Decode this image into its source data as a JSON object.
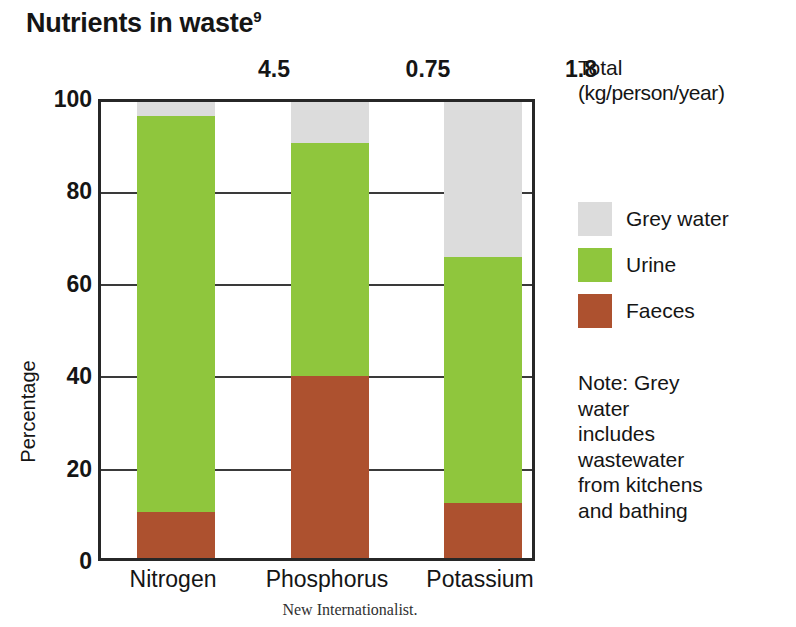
{
  "title": {
    "text": "Nutrients in waste",
    "superscript": "9"
  },
  "source": "New Internationalist.",
  "totals_caption": {
    "line1": "Total",
    "line2": "(kg/person/year)"
  },
  "legend": {
    "items": [
      {
        "label": "Grey water",
        "color": "#dcdcdc",
        "key": "grey_water"
      },
      {
        "label": "Urine",
        "color": "#8fc63d",
        "key": "urine"
      },
      {
        "label": "Faeces",
        "color": "#ad512f",
        "key": "faeces"
      }
    ]
  },
  "note": {
    "lines": [
      "Note: Grey",
      "water",
      "includes",
      "wastewater",
      "from kitchens",
      "and bathing"
    ]
  },
  "axes": {
    "y_title": "Percentage",
    "y_ticks": [
      "100",
      "80",
      "60",
      "40",
      "20",
      "0"
    ]
  },
  "chart_data": {
    "type": "bar",
    "subtype": "stacked-bar-100",
    "title": "Nutrients in waste",
    "xlabel": "",
    "ylabel": "Percentage",
    "ylim": [
      0,
      100
    ],
    "yticks": [
      0,
      20,
      40,
      60,
      80,
      100
    ],
    "grid": true,
    "legend_position": "right",
    "categories": [
      "Nitrogen",
      "Phosphorus",
      "Potassium"
    ],
    "category_totals": [
      "4.5",
      "0.75",
      "1.8"
    ],
    "category_totals_units": "kg/person/year",
    "series": [
      {
        "name": "Faeces",
        "color": "#ad512f",
        "values": [
          10,
          40,
          12
        ]
      },
      {
        "name": "Urine",
        "color": "#8fc63d",
        "values": [
          87,
          51,
          54
        ]
      },
      {
        "name": "Grey water",
        "color": "#dcdcdc",
        "values": [
          3,
          9,
          34
        ]
      }
    ],
    "stack_tops": {
      "Nitrogen": {
        "faeces": 10,
        "urine": 97,
        "grey_water": 100
      },
      "Phosphorus": {
        "faeces": 40,
        "urine": 91,
        "grey_water": 100
      },
      "Potassium": {
        "faeces": 12,
        "urine": 66,
        "grey_water": 100
      }
    },
    "annotations": [
      "Note: Grey water includes wastewater from kitchens and bathing"
    ]
  }
}
